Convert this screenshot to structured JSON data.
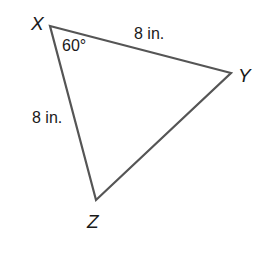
{
  "diagram": {
    "type": "triangle",
    "stroke_color": "#555555",
    "text_color": "#1a1a1a",
    "vertices": {
      "X": {
        "label": "X",
        "x": 50,
        "y": 26
      },
      "Y": {
        "label": "Y",
        "x": 231,
        "y": 73
      },
      "Z": {
        "label": "Z",
        "x": 96,
        "y": 200
      }
    },
    "angle_label": "60°",
    "side_XY_label": "8 in.",
    "side_XZ_label": "8 in."
  }
}
